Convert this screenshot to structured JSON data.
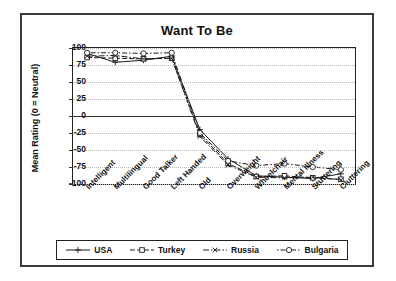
{
  "chart_data": {
    "type": "line",
    "title": "Want To Be",
    "xlabel": "",
    "ylabel": "Mean Rating (0 = Neutral)",
    "ylim": [
      -100,
      100
    ],
    "yticks": [
      100,
      75,
      50,
      25,
      0,
      -25,
      -50,
      -75,
      -100
    ],
    "grid": true,
    "legend_position": "bottom",
    "categories": [
      "Intelligent",
      "Multilingual",
      "Good Talker",
      "Left Handed",
      "Old",
      "Overweight",
      "Wheelchair",
      "Mental Illness",
      "Stuttering",
      "Cluttering"
    ],
    "series": [
      {
        "name": "USA",
        "color": "#1a1a1a",
        "dash": "none",
        "marker": "plus",
        "values": [
          92,
          79,
          82,
          88,
          -20,
          -63,
          -88,
          -90,
          -92,
          -85
        ]
      },
      {
        "name": "Turkey",
        "color": "#1a1a1a",
        "dash": "dash",
        "marker": "square",
        "values": [
          86,
          85,
          84,
          85,
          -27,
          -70,
          -89,
          -88,
          -91,
          -93
        ]
      },
      {
        "name": "Russia",
        "color": "#1a1a1a",
        "dash": "dashdot",
        "marker": "cross",
        "values": [
          88,
          89,
          84,
          85,
          -30,
          -72,
          -90,
          -91,
          -90,
          -94
        ]
      },
      {
        "name": "Bulgaria",
        "color": "#1a1a1a",
        "dash": "dotdash",
        "marker": "circle",
        "values": [
          93,
          93,
          92,
          93,
          -25,
          -66,
          -73,
          -70,
          -75,
          -79
        ]
      }
    ]
  }
}
